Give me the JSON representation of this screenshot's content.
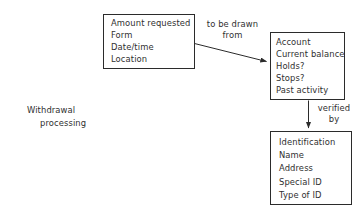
{
  "diagram": {
    "title": "Withdrawal processing",
    "caption": {
      "line1": "Withdrawal",
      "line2": "processing"
    },
    "colors": {
      "background": "#ffffff",
      "stroke": "#2b2b2b",
      "text": "#2f2f2f"
    },
    "nodes": [
      {
        "id": "request",
        "name": "request-box",
        "lines": [
          "Amount requested",
          "Form",
          "Date/time",
          "Location"
        ]
      },
      {
        "id": "account",
        "name": "account-box",
        "lines": [
          "Account",
          "Current balance",
          "Holds?",
          "Stops?",
          "Past activity"
        ]
      },
      {
        "id": "identity",
        "name": "identity-box",
        "lines": [
          "Identification",
          "Name",
          "Address",
          "Special ID",
          "Type of ID"
        ]
      }
    ],
    "edges": [
      {
        "id": "request-to-account",
        "from": "request",
        "to": "account",
        "label_line1": "to be drawn",
        "label_line2": "from"
      },
      {
        "id": "account-to-identity",
        "from": "account",
        "to": "identity",
        "label_line1": "verified",
        "label_line2": "by"
      }
    ]
  }
}
